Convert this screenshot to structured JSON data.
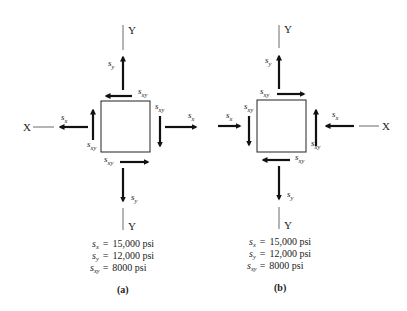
{
  "figures": [
    {
      "id": "a",
      "caption": "(a)",
      "axes": {
        "x_label": "X",
        "y_top_label": "Y",
        "y_bottom_label": "Y"
      },
      "labels": {
        "sx": "s",
        "sx_sub": "x",
        "sy": "s",
        "sy_sub": "y",
        "sxy": "s",
        "sxy_sub": "xy"
      },
      "stress_state": "sx tension (arrows outward), sy tension (arrows outward), shear: top face leftward, right face downward, left face upward, bottom face rightward",
      "values": [
        {
          "symbol": "s",
          "sub": "x",
          "eq": "=",
          "value": "15,000 psi"
        },
        {
          "symbol": "s",
          "sub": "y",
          "eq": "=",
          "value": "12,000 psi"
        },
        {
          "symbol": "s",
          "sub": "xy",
          "eq": "=",
          "value": "8000 psi"
        }
      ]
    },
    {
      "id": "b",
      "caption": "(b)",
      "axes": {
        "x_label": "X",
        "y_top_label": "Y",
        "y_bottom_label": "Y"
      },
      "labels": {
        "sx": "s",
        "sx_sub": "x",
        "sy": "s",
        "sy_sub": "y",
        "sxy": "s",
        "sxy_sub": "xy"
      },
      "stress_state": "sx compression (arrows inward), sy tension (arrows outward), shear: top face rightward, left face downward, right face upward, bottom face leftward",
      "values": [
        {
          "symbol": "s",
          "sub": "x",
          "eq": "=",
          "value": "15,000 psi"
        },
        {
          "symbol": "s",
          "sub": "y",
          "eq": "=",
          "value": "12,000 psi"
        },
        {
          "symbol": "s",
          "sub": "xy",
          "eq": "=",
          "value": "8000 psi"
        }
      ]
    }
  ],
  "colors": {
    "ink": "#111111",
    "background": "#ffffff"
  }
}
